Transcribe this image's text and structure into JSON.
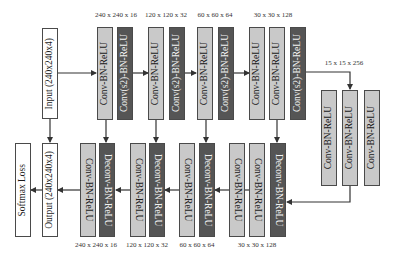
{
  "diagram": {
    "encoder": {
      "input": "Input (240x240x4)",
      "blocks": [
        {
          "label": "Conv-BN-ReLU",
          "type": "light"
        },
        {
          "label": "Conv(s2)-BN-ReLU",
          "type": "dark"
        },
        {
          "label": "Conv-BN-ReLU",
          "type": "light"
        },
        {
          "label": "Conv(s2)-BN-ReLU",
          "type": "dark"
        },
        {
          "label": "Conv-BN-ReLU",
          "type": "light"
        },
        {
          "label": "Conv(s2)-BN-ReLU",
          "type": "dark"
        },
        {
          "label": "Conv-BN-ReLU",
          "type": "light"
        },
        {
          "label": "Conv-BN-ReLU",
          "type": "light"
        },
        {
          "label": "Conv(s2)-BN-ReLU",
          "type": "dark"
        }
      ],
      "dims": [
        "240 x 240 x 16",
        "120 x 120 x 32",
        "60 x 60 x 64",
        "30 x 30 x 128"
      ]
    },
    "bottleneck": {
      "dim": "15 x 15 x 256",
      "blocks": [
        {
          "label": "Conv-BN-ReLU",
          "type": "light"
        },
        {
          "label": "Conv-BN-ReLU",
          "type": "light"
        },
        {
          "label": "Conv-BN-ReLU",
          "type": "light"
        }
      ]
    },
    "decoder": {
      "loss": "Softmax Loss",
      "output": "Output (240x240x4)",
      "blocks": [
        {
          "label": "Conv-BN-ReLU",
          "type": "light"
        },
        {
          "label": "Deconv-BN-ReLU",
          "type": "dark"
        },
        {
          "label": "Conv-BN-ReLU",
          "type": "light"
        },
        {
          "label": "Deconv-BN-ReLU",
          "type": "dark"
        },
        {
          "label": "Conv-BN-ReLU",
          "type": "light"
        },
        {
          "label": "Deconv-BN-ReLU",
          "type": "dark"
        },
        {
          "label": "Conv-BN-ReLU",
          "type": "light"
        },
        {
          "label": "Conv-BN-ReLU",
          "type": "light"
        },
        {
          "label": "Deconv-BN-ReLU",
          "type": "dark"
        }
      ],
      "dims": [
        "240 x 240 x 16",
        "120 x 120 x 32",
        "60 x 60 x 64",
        "30 x 30 x 128"
      ]
    },
    "colors": {
      "light_block": "#c9c9c9",
      "dark_block": "#555555",
      "io_block": "#ffffff",
      "line": "#333333"
    }
  }
}
